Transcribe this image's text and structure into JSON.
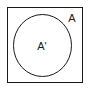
{
  "figure": {
    "type": "set-diagram",
    "background_color": "#ffffff",
    "stroke_color": "#1a1a1a",
    "universe": {
      "shape": "rectangle",
      "label": "A",
      "fill": "#ffffff",
      "stroke": "#1a1a1a",
      "x": 7,
      "y": 7,
      "width": 76,
      "height": 76,
      "stroke_width": 1
    },
    "subset": {
      "shape": "ellipse",
      "label": "A'",
      "fill": "none",
      "stroke": "#1a1a1a",
      "cx": 42.5,
      "cy": 45.5,
      "rx": 29.5,
      "ry": 31.5,
      "stroke_width": 1
    },
    "labels": [
      {
        "name": "outer-set-label",
        "text": "A",
        "x": 72,
        "y": 22,
        "font_size": 11
      },
      {
        "name": "inner-set-label",
        "text": "A'",
        "x": 42,
        "y": 50,
        "font_size": 11
      }
    ]
  }
}
